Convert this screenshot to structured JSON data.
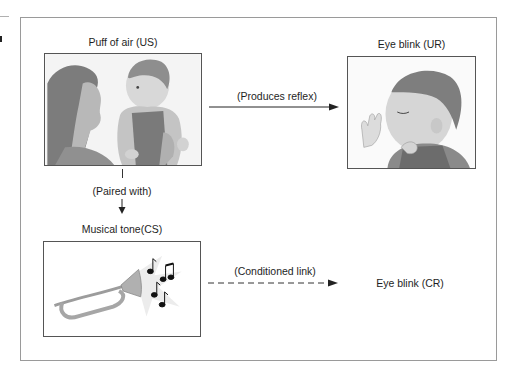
{
  "diagram": {
    "type": "classical-conditioning-flow",
    "nodes": {
      "us": {
        "label": "Puff of air (US)",
        "illustration": "mother-holding-baby"
      },
      "ur": {
        "label": "Eye blink (UR)",
        "illustration": "baby-blinking"
      },
      "cs": {
        "label": "Musical tone(CS)",
        "illustration": "bugle-with-music-notes"
      },
      "cr": {
        "label": "Eye blink (CR)"
      }
    },
    "edges": [
      {
        "from": "us",
        "to": "ur",
        "label": "(Produces reflex)",
        "style": "solid"
      },
      {
        "from": "us",
        "to": "cs",
        "label": "(Paired with)",
        "style": "solid"
      },
      {
        "from": "cs",
        "to": "cr",
        "label": "(Conditioned link)",
        "style": "dashed"
      }
    ]
  },
  "colors": {
    "frame": "#9a9a9a",
    "box_border": "#555555",
    "text": "#1e1e1e",
    "arrow": "#222222",
    "illustration_gray": "#8a8a8a",
    "bugle_metal": "#a8a8a8"
  }
}
